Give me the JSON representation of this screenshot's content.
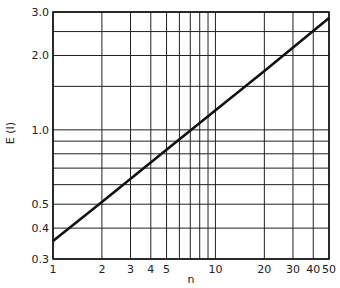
{
  "chart_data": {
    "type": "line",
    "title": "",
    "xlabel": "n",
    "ylabel": "E (I)",
    "xscale": "log",
    "yscale": "log",
    "xlim": [
      1,
      50
    ],
    "ylim": [
      0.3,
      3.0
    ],
    "grid": true,
    "x_gridlines": [
      1,
      2,
      3,
      4,
      5,
      6,
      7,
      8,
      9,
      10,
      20,
      30,
      40,
      50
    ],
    "y_gridlines": [
      0.3,
      0.4,
      0.5,
      0.6,
      0.7,
      0.8,
      0.9,
      1.0,
      1.5,
      2.0,
      2.5,
      3.0
    ],
    "x_ticks": [
      {
        "value": 1,
        "label": "1"
      },
      {
        "value": 2,
        "label": "2"
      },
      {
        "value": 3,
        "label": "3"
      },
      {
        "value": 4,
        "label": "4"
      },
      {
        "value": 5,
        "label": "5"
      },
      {
        "value": 10,
        "label": "10"
      },
      {
        "value": 20,
        "label": "20"
      },
      {
        "value": 30,
        "label": "30"
      },
      {
        "value": 40,
        "label": "40"
      },
      {
        "value": 50,
        "label": "50"
      }
    ],
    "y_ticks": [
      {
        "value": 0.3,
        "label": "0.3"
      },
      {
        "value": 0.4,
        "label": "0.4"
      },
      {
        "value": 0.5,
        "label": "0.5"
      },
      {
        "value": 1.0,
        "label": "1.0"
      },
      {
        "value": 2.0,
        "label": "2.0"
      },
      {
        "value": 3.0,
        "label": "3.0"
      }
    ],
    "series": [
      {
        "name": "E(I)",
        "color": "#111111",
        "x": [
          1,
          2,
          5,
          10,
          20,
          50
        ],
        "y": [
          0.355,
          0.51,
          0.83,
          1.2,
          1.73,
          2.84
        ]
      }
    ],
    "legend": "none"
  }
}
